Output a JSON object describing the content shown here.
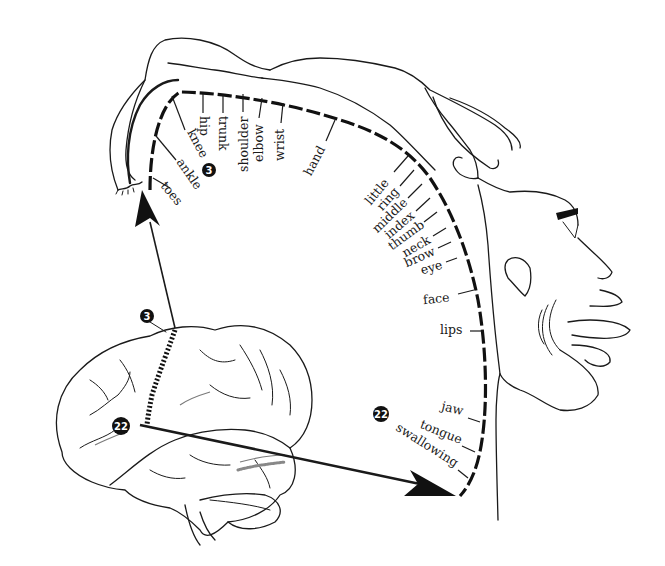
{
  "diagram": {
    "type": "motor-homunculus",
    "strip_labels": [
      {
        "id": "toes",
        "label": "toes"
      },
      {
        "id": "ankle",
        "label": "ankle"
      },
      {
        "id": "knee",
        "label": "knee"
      },
      {
        "id": "hip",
        "label": "hip"
      },
      {
        "id": "trunk",
        "label": "trunk"
      },
      {
        "id": "shoulder",
        "label": "shoulder"
      },
      {
        "id": "elbow",
        "label": "elbow"
      },
      {
        "id": "wrist",
        "label": "wrist"
      },
      {
        "id": "hand",
        "label": "hand"
      },
      {
        "id": "little",
        "label": "little"
      },
      {
        "id": "ring",
        "label": "ring"
      },
      {
        "id": "middle",
        "label": "middle"
      },
      {
        "id": "index",
        "label": "index"
      },
      {
        "id": "thumb",
        "label": "thumb"
      },
      {
        "id": "neck",
        "label": "neck"
      },
      {
        "id": "brow",
        "label": "brow"
      },
      {
        "id": "eye",
        "label": "eye"
      },
      {
        "id": "face",
        "label": "face"
      },
      {
        "id": "lips",
        "label": "lips"
      },
      {
        "id": "jaw",
        "label": "jaw"
      },
      {
        "id": "tongue",
        "label": "tongue"
      },
      {
        "id": "swallowing",
        "label": "swallowing"
      }
    ],
    "badges": {
      "top_strip": "3",
      "brain_top": "3",
      "brain_lower": "22",
      "lower_strip": "22"
    }
  }
}
